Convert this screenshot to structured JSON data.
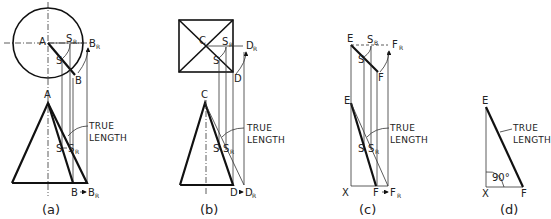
{
  "figure": {
    "panels": [
      {
        "caption": "(a)",
        "top_view_shape": "circle",
        "labels": {
          "apex_top": "A",
          "point_top": "B",
          "rev_point_top": "B",
          "rev_sub": "R",
          "s": "S",
          "s_rev": "S",
          "s_rev_sub": "R",
          "apex_front": "A",
          "point_front": "B",
          "rev_front": "B",
          "rev_front_sub": "R",
          "s_front": "S",
          "s_rev_front": "S",
          "s_rev_front_sub": "R"
        },
        "annotation": [
          "TRUE",
          "LENGTH"
        ]
      },
      {
        "caption": "(b)",
        "top_view_shape": "square",
        "labels": {
          "apex_top": "C",
          "point_top": "D",
          "rev_point_top": "D",
          "rev_sub": "R",
          "s": "S",
          "s_rev": "S",
          "s_rev_sub": "R",
          "apex_front": "C",
          "point_front": "D",
          "rev_front": "D",
          "rev_front_sub": "R",
          "s_front": "S",
          "s_rev_front": "S",
          "s_rev_front_sub": "R"
        },
        "annotation": [
          "TRUE",
          "LENGTH"
        ]
      },
      {
        "caption": "(c)",
        "top_view_shape": "line",
        "labels": {
          "apex_top": "E",
          "point_top": "F",
          "rev_point_top": "F",
          "rev_sub": "R",
          "s": "S",
          "s_rev": "S",
          "s_rev_sub": "B",
          "apex_front": "E",
          "point_front": "F",
          "rev_front": "F",
          "rev_front_sub": "R",
          "s_front": "S",
          "s_rev_front": "S",
          "s_rev_front_sub": "R",
          "base": "X"
        },
        "annotation": [
          "TRUE",
          "LENGTH"
        ]
      },
      {
        "caption": "(d)",
        "top_view_shape": "none",
        "labels": {
          "apex_front": "E",
          "point_front": "F",
          "base": "X",
          "angle": "90°"
        },
        "annotation": [
          "TRUE",
          "LENGTH"
        ]
      }
    ],
    "arrow": "→"
  }
}
